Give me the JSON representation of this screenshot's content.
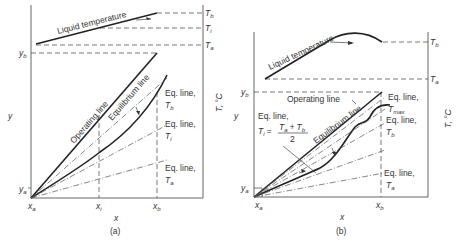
{
  "panel_a": {
    "caption": "(a)",
    "liquid_temperature_label": "Liquid temperature",
    "temp_axis_ticks": [
      "T",
      "T",
      "T"
    ],
    "temp_axis_subs": [
      "b",
      "i",
      "a"
    ],
    "temp_axis_label": "T, °C",
    "y_axis_label": "y",
    "x_axis_label": "x",
    "y_ticks": [
      {
        "main": "y",
        "sub": "b"
      },
      {
        "main": "y",
        "sub": "a"
      }
    ],
    "x_ticks": [
      {
        "main": "x",
        "sub": "a"
      },
      {
        "main": "x",
        "sub": "i"
      },
      {
        "main": "x",
        "sub": "b"
      }
    ],
    "operating_line_label": "Operating line",
    "equilibrium_line_label": "Equilibrium line",
    "eq_lines": [
      {
        "line1": "Eq. line,",
        "T": "T",
        "sub": "b"
      },
      {
        "line1": "Eq. line,",
        "T": "T",
        "sub": "i"
      },
      {
        "line1": "Eq. line,",
        "T": "T",
        "sub": "a"
      }
    ]
  },
  "panel_b": {
    "caption": "(b)",
    "liquid_temperature_label": "Liquid temperature",
    "temp_axis_ticks": [
      "T",
      "T"
    ],
    "temp_axis_subs": [
      "b",
      "a"
    ],
    "temp_axis_label": "T, °C",
    "y_axis_label": "y",
    "x_axis_label": "x",
    "y_ticks": [
      {
        "main": "y",
        "sub": "b"
      },
      {
        "main": "y",
        "sub": "a"
      }
    ],
    "x_ticks": [
      {
        "main": "x",
        "sub": "a"
      },
      {
        "main": "x",
        "sub": "b"
      }
    ],
    "operating_line_label": "Operating line",
    "equilibrium_line_label": "Equilibrium line",
    "eq_line_ti": {
      "line1": "Eq. line,",
      "T": "T",
      "sub": "i",
      "eq": "=",
      "num": "T",
      "num_sub_a": "a",
      "plus": "+",
      "num_sub_b": "b",
      "den": "2"
    },
    "eq_lines": [
      {
        "line1": "Eq. line,",
        "T": "T",
        "sub": "max"
      },
      {
        "line1": "Eq. line,",
        "T": "T",
        "sub": "b"
      },
      {
        "line1": "Eq. line,",
        "T": "T",
        "sub": "a"
      }
    ]
  }
}
